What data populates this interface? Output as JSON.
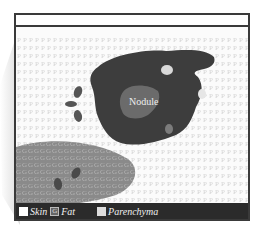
{
  "diagram": {
    "title": "",
    "labels": {
      "nodule": "Nodule"
    },
    "patterns": {
      "parenchyma_glyph": "P",
      "fat_glyph": "G"
    },
    "colors": {
      "frame": "#3a3a3a",
      "parenchyma_text": "#d2d2d2",
      "nodule_body": "#3d3d3d",
      "nodule_core": "#6b6b6b",
      "fat_region": "#8a8a8a",
      "fat_text": "#b8b8b8",
      "legend_bg": "#2b2b2b"
    }
  },
  "legend": {
    "items": [
      {
        "swatch": "white",
        "label": "Skin"
      },
      {
        "swatch": "G",
        "label": "Fat"
      },
      {
        "swatch": "light-grey",
        "label": "Parenchyma"
      }
    ]
  }
}
